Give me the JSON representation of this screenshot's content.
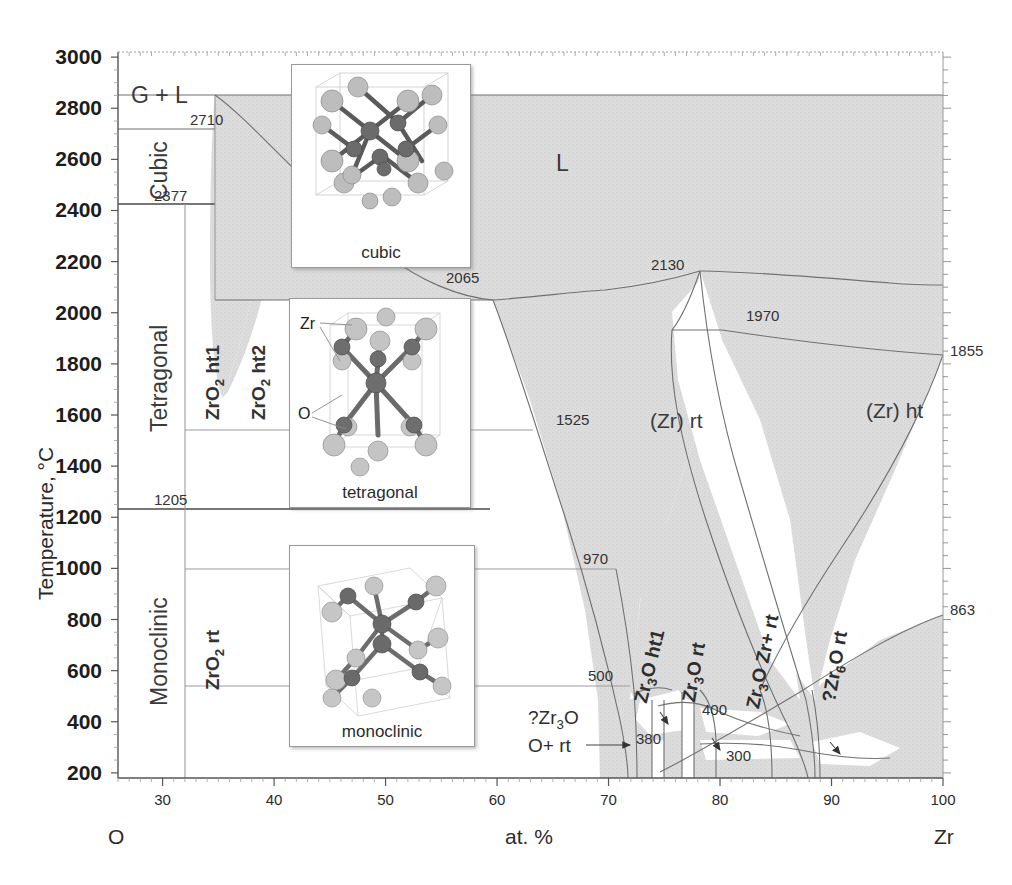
{
  "chart_data": {
    "type": "phase-diagram",
    "xlabel": "at. %",
    "ylabel": "Temperature, °C",
    "xlim": [
      26,
      100
    ],
    "ylim": [
      180,
      3020
    ],
    "x_ticks": [
      "30",
      "40",
      "50",
      "60",
      "70",
      "80",
      "90",
      "100"
    ],
    "x_tick_values": [
      30,
      40,
      50,
      60,
      70,
      80,
      90,
      100
    ],
    "y_ticks": [
      "200",
      "400",
      "600",
      "800",
      "1000",
      "1200",
      "1400",
      "1600",
      "1800",
      "2000",
      "2200",
      "2400",
      "2600",
      "2800",
      "3000"
    ],
    "y_tick_values": [
      200,
      400,
      600,
      800,
      1000,
      1200,
      1400,
      1600,
      1800,
      2000,
      2200,
      2400,
      2600,
      2800,
      3000
    ],
    "left_endmember": "O",
    "right_endmember": "Zr",
    "grid": false,
    "legend": "none",
    "invariant_temperatures": [
      2710,
      2377,
      2130,
      2065,
      1970,
      1855,
      1525,
      1205,
      970,
      863,
      500,
      400,
      380,
      300
    ],
    "phase_fields": [
      {
        "label": "G  +  L",
        "x": 38,
        "y": 2800
      },
      {
        "label": "L",
        "x": 63,
        "y": 2600
      },
      {
        "label": "Cubic",
        "x": 30.5,
        "y": 2540
      },
      {
        "label": "Tetragonal",
        "x": 30.5,
        "y": 1800
      },
      {
        "label": "Monoclinic",
        "x": 30.5,
        "y": 700
      },
      {
        "label": "ZrO2 ht2",
        "x": 37.5,
        "y": 1950
      },
      {
        "label": "ZrO2 ht1",
        "x": 34.8,
        "y": 1700
      },
      {
        "label": "ZrO2 rt",
        "x": 34.8,
        "y": 700
      },
      {
        "label": "(Zr) rt",
        "x": 78,
        "y": 1500
      },
      {
        "label": "(Zr) ht",
        "x": 92,
        "y": 1560
      },
      {
        "label": "Zr3O ht1",
        "x": 73,
        "y": 650
      },
      {
        "label": "Zr3O rt",
        "x": 76.5,
        "y": 650
      },
      {
        "label": "Zr3O Zr+ rt",
        "x": 81,
        "y": 650
      },
      {
        "label": "?Zr6O rt",
        "x": 87,
        "y": 620
      },
      {
        "label": "?Zr3O O+ rt",
        "x": 66,
        "y": 300
      }
    ]
  },
  "axes": {
    "y_title": "Temperature, °C",
    "x_title": "at. %",
    "left_corner_label": "O",
    "right_corner_label": "Zr",
    "y_ticks": [
      "3000",
      "2800",
      "2600",
      "2400",
      "2200",
      "2000",
      "1800",
      "1600",
      "1400",
      "1200",
      "1000",
      "800",
      "600",
      "400",
      "200"
    ],
    "x_ticks": [
      "30",
      "40",
      "50",
      "60",
      "70",
      "80",
      "90",
      "100"
    ]
  },
  "fields": {
    "gas_liquid": "G  +  L",
    "liquid": "L",
    "cubic": "Cubic",
    "tetragonal": "Tetragonal",
    "monoclinic": "Monoclinic",
    "zro2_ht2": "ZrO2 ht2",
    "zro2_ht1": "ZrO2 ht1",
    "zro2_rt": "ZrO2 rt",
    "zr_rt": "(Zr) rt",
    "zr_ht": "(Zr) ht",
    "zr3o_ht1": "Zr3O ht1",
    "zr3o_rt": "Zr3O rt",
    "zr3o_zr_rt": "Zr3O Zr+ rt",
    "zr6o_rt": "?Zr6O rt",
    "qzr3o_line1": "?Zr3O",
    "qzr3o_line2": "O+ rt"
  },
  "invariants": {
    "t2710": "2710",
    "t2377": "2377",
    "t2130": "2130",
    "t2065": "2065",
    "t1970": "1970",
    "t1855": "1855",
    "t1525": "1525",
    "t1205": "1205",
    "t970": "970",
    "t863": "863",
    "t500": "500",
    "t400": "400",
    "t380": "380",
    "t300": "300"
  },
  "insets": [
    {
      "caption": "cubic",
      "atoms": []
    },
    {
      "caption": "tetragonal",
      "atoms": [
        "Zr",
        "O"
      ]
    },
    {
      "caption": "monoclinic",
      "atoms": []
    }
  ],
  "inset_labels": {
    "cubic": "cubic",
    "tetragonal": "tetragonal",
    "monoclinic": "monoclinic",
    "zr_atom": "Zr",
    "o_atom": "O"
  },
  "colors": {
    "shaded_field": "#dcdcdc",
    "line": "#6a6a6a",
    "axis": "#555555",
    "text": "#2b2b2b"
  }
}
